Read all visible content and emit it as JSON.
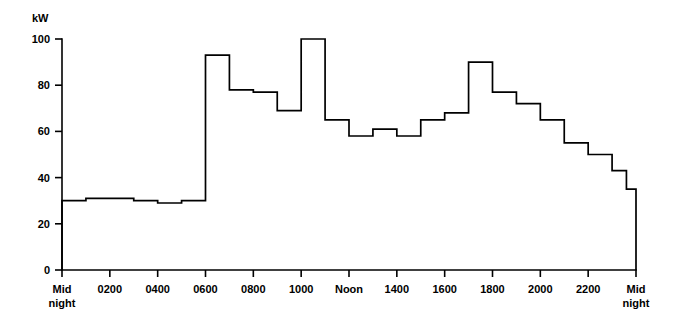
{
  "chart_data": {
    "type": "line",
    "subtype": "step-post",
    "title": "",
    "xlabel": "",
    "ylabel": "kW",
    "ylim": [
      0,
      100
    ],
    "xlim": [
      0,
      24
    ],
    "grid": false,
    "legend": null,
    "y_ticks": [
      0,
      20,
      40,
      60,
      80,
      100
    ],
    "y_tick_labels": [
      "0",
      "20",
      "40",
      "60",
      "80",
      "100"
    ],
    "x_ticks": [
      0,
      2,
      4,
      6,
      8,
      10,
      12,
      14,
      16,
      18,
      20,
      22,
      24
    ],
    "x_tick_labels": [
      "Mid\nnight",
      "0200",
      "0400",
      "0600",
      "0800",
      "1000",
      "Noon",
      "1400",
      "1600",
      "1800",
      "2000",
      "2200",
      "Mid\nnight"
    ],
    "x_tick_labels_flat": [
      [
        "Mid",
        "night"
      ],
      [
        "0200"
      ],
      [
        "0400"
      ],
      [
        "0600"
      ],
      [
        "0800"
      ],
      [
        "1000"
      ],
      [
        "Noon"
      ],
      [
        "1400"
      ],
      [
        "1600"
      ],
      [
        "1800"
      ],
      [
        "2000"
      ],
      [
        "2200"
      ],
      [
        "Mid",
        "night"
      ]
    ],
    "x": [
      0,
      1,
      2,
      3,
      4,
      5,
      6,
      7,
      8,
      9,
      10,
      11,
      12,
      13,
      14,
      15,
      16,
      17,
      18,
      19,
      20,
      21,
      22,
      23,
      24
    ],
    "values": [
      30,
      31,
      31,
      30,
      29,
      30,
      93,
      78,
      77,
      69,
      100,
      65,
      58,
      61,
      58,
      65,
      68,
      90,
      77,
      72,
      65,
      55,
      50,
      43,
      35
    ],
    "series": [
      {
        "name": "Demand",
        "unit": "kW",
        "values": [
          30,
          31,
          31,
          30,
          29,
          30,
          93,
          78,
          77,
          69,
          100,
          65,
          58,
          61,
          58,
          65,
          68,
          90,
          77,
          72,
          65,
          55,
          50,
          43,
          35
        ]
      }
    ],
    "steps": [
      {
        "start": 0,
        "end": 1,
        "value": 30
      },
      {
        "start": 1,
        "end": 3,
        "value": 31
      },
      {
        "start": 3,
        "end": 4,
        "value": 30
      },
      {
        "start": 4,
        "end": 5,
        "value": 29
      },
      {
        "start": 5,
        "end": 6,
        "value": 30
      },
      {
        "start": 6,
        "end": 7,
        "value": 93
      },
      {
        "start": 7,
        "end": 8,
        "value": 78
      },
      {
        "start": 8,
        "end": 9,
        "value": 77
      },
      {
        "start": 9,
        "end": 10,
        "value": 69
      },
      {
        "start": 10,
        "end": 11,
        "value": 100
      },
      {
        "start": 11,
        "end": 12,
        "value": 65
      },
      {
        "start": 12,
        "end": 13,
        "value": 58
      },
      {
        "start": 13,
        "end": 14,
        "value": 61
      },
      {
        "start": 14,
        "end": 15,
        "value": 58
      },
      {
        "start": 15,
        "end": 16,
        "value": 65
      },
      {
        "start": 16,
        "end": 17,
        "value": 68
      },
      {
        "start": 17,
        "end": 18,
        "value": 90
      },
      {
        "start": 18,
        "end": 19,
        "value": 77
      },
      {
        "start": 19,
        "end": 20,
        "value": 72
      },
      {
        "start": 20,
        "end": 21,
        "value": 65
      },
      {
        "start": 21,
        "end": 22,
        "value": 55
      },
      {
        "start": 22,
        "end": 23,
        "value": 50
      },
      {
        "start": 23,
        "end": 23.6,
        "value": 43
      },
      {
        "start": 23.6,
        "end": 24,
        "value": 35
      }
    ],
    "colors": {
      "line": "#000000",
      "axis": "#000000",
      "background": "#ffffff"
    }
  }
}
